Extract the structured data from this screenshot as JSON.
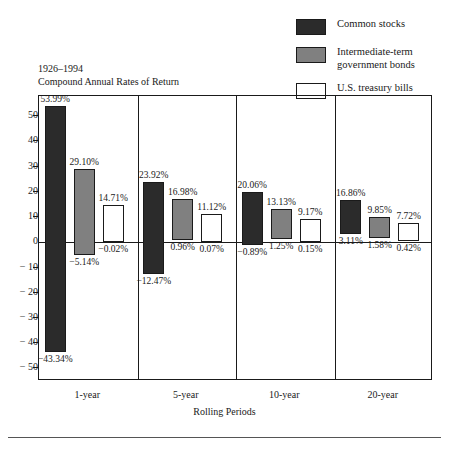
{
  "chart_data": {
    "type": "bar",
    "title_line1": "1926–1994",
    "title_line2": "Compound Annual Rates of Return",
    "xlabel": "Rolling Periods",
    "ylabel": "",
    "ylim": [
      -55,
      58
    ],
    "grid": false,
    "legend_position": "top-right",
    "categories": [
      "1-year",
      "5-year",
      "10-year",
      "20-year"
    ],
    "yticks": [
      50,
      40,
      30,
      20,
      10,
      0,
      "− 10",
      "− 20",
      "− 30",
      "− 40",
      "− 50"
    ],
    "ytick_values": [
      50,
      40,
      30,
      20,
      10,
      0,
      -10,
      -20,
      -30,
      -40,
      -50
    ],
    "series": [
      {
        "name": "Common stocks",
        "color": "#2b2b2b",
        "high_values": [
          53.99,
          23.92,
          20.06,
          16.86
        ],
        "low_values": [
          -43.34,
          -12.47,
          -0.89,
          3.11
        ],
        "high_labels": [
          "53.99%",
          "23.92%",
          "20.06%",
          "16.86%"
        ],
        "low_labels": [
          "−43.34%",
          "−12.47%",
          "−0.89%",
          "3.11%"
        ]
      },
      {
        "name": "Intermediate-term government bonds",
        "color": "#808080",
        "high_values": [
          29.1,
          16.98,
          13.13,
          9.85
        ],
        "low_values": [
          -5.14,
          0.96,
          1.25,
          1.58
        ],
        "high_labels": [
          "29.10%",
          "16.98%",
          "13.13%",
          "9.85%"
        ],
        "low_labels": [
          "−5.14%",
          "0.96%",
          "1.25%",
          "1.58%"
        ]
      },
      {
        "name": "U.S. treasury bills",
        "color": "#ffffff",
        "high_values": [
          14.71,
          11.12,
          9.17,
          7.72
        ],
        "low_values": [
          -0.02,
          0.07,
          0.15,
          0.42
        ],
        "high_labels": [
          "14.71%",
          "11.12%",
          "9.17%",
          "7.72%"
        ],
        "low_labels": [
          "−0.02%",
          "0.07%",
          "0.15%",
          "0.42%"
        ]
      }
    ]
  },
  "legend": {
    "items": [
      {
        "label": "Common stocks",
        "swatch": "sw-stocks",
        "name": "legend-swatch-common-stocks"
      },
      {
        "label": "Intermediate-term\ngovernment bonds",
        "swatch": "sw-bonds",
        "name": "legend-swatch-intermediate-bonds"
      },
      {
        "label": "U.S. treasury bills",
        "swatch": "sw-bills",
        "name": "legend-swatch-treasury-bills"
      }
    ]
  }
}
